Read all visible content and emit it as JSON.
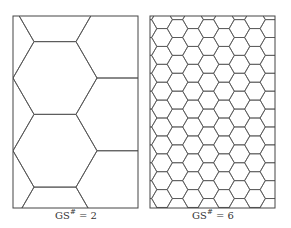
{
  "colors": {
    "stroke": "#555555",
    "frame": "#444444",
    "background": "#ffffff"
  },
  "panels": [
    {
      "id": "gs2",
      "label_prefix": "GS",
      "label_sup": "#",
      "label_suffix": " = 2",
      "label_pos": {
        "x": 76,
        "y": 209
      },
      "frame": {
        "x": 13,
        "y": 16,
        "w": 125,
        "h": 192
      },
      "hex": {
        "side": 42,
        "col0_x": 55,
        "col0_y": 78,
        "cols": [
          -2,
          4
        ],
        "rows": [
          -3,
          4
        ]
      }
    },
    {
      "id": "gs6",
      "label_prefix": "GS",
      "label_sup": "#",
      "label_suffix": " = 6",
      "label_pos": {
        "x": 213,
        "y": 209
      },
      "frame": {
        "x": 150,
        "y": 16,
        "w": 125,
        "h": 192
      },
      "hex": {
        "side": 10.33,
        "col0_x": 162,
        "col0_y": 37.5,
        "cols": [
          -2,
          10
        ],
        "rows": [
          -2,
          14
        ]
      }
    }
  ]
}
